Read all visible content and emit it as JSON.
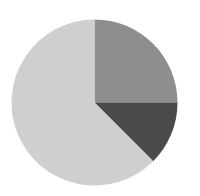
{
  "chart_data": {
    "type": "pie",
    "title": "",
    "legend": [],
    "start_angle_deg": 0,
    "direction": "clockwise",
    "center": [
      94.5,
      102.5
    ],
    "radius": 83,
    "slices": [
      {
        "label": "",
        "value": 25.0,
        "color": "#8e8e8e"
      },
      {
        "label": "",
        "value": 12.5,
        "color": "#4a4a4a"
      },
      {
        "label": "",
        "value": 62.5,
        "color": "#cfcfcf"
      }
    ]
  }
}
